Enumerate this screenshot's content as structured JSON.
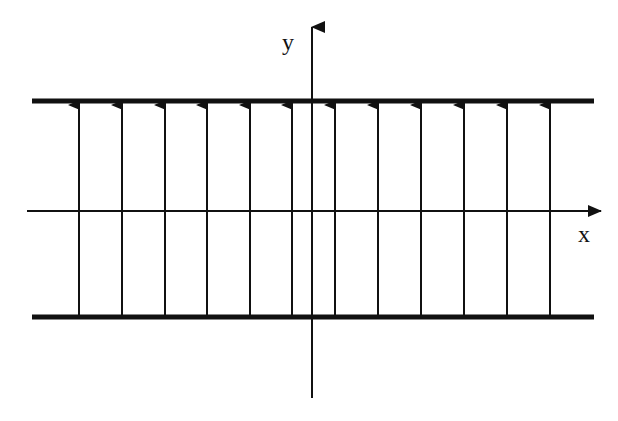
{
  "diagram": {
    "axes": {
      "x_label": "x",
      "y_label": "y"
    },
    "plates": [
      {
        "name": "top-plate",
        "y": 101
      },
      {
        "name": "bottom-plate",
        "y": 317
      }
    ],
    "arrow_count": 12,
    "arrow_direction": "up",
    "colors": {
      "line": "#111111",
      "background": "#ffffff"
    }
  }
}
